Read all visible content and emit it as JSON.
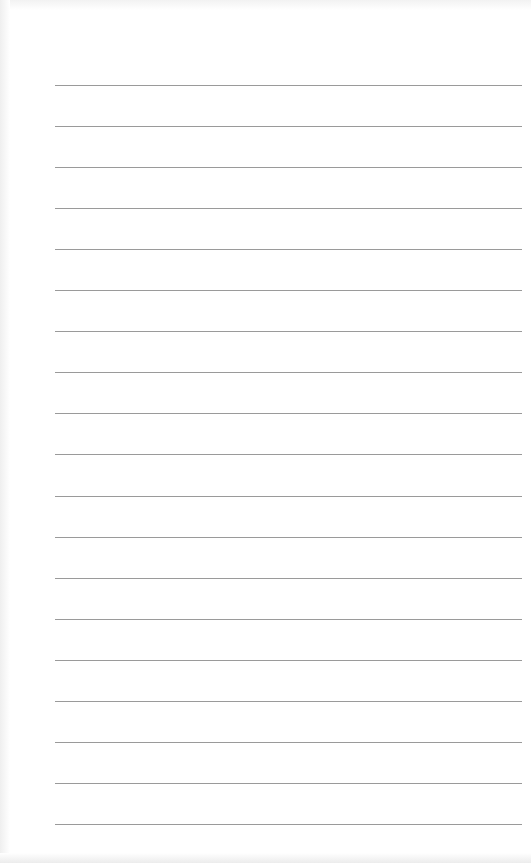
{
  "page": {
    "type": "lined-paper",
    "line_count": 19,
    "line_color": "#9a9a9a",
    "background_color": "#ffffff",
    "line_start_x": 55,
    "line_end_x": 522,
    "first_line_y": 85,
    "line_spacing": 41.05
  }
}
